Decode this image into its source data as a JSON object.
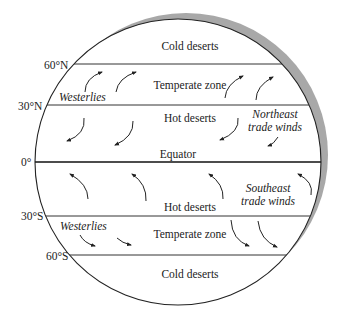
{
  "latitudes": {
    "n60": "60°N",
    "n30": "30°N",
    "eq": "0°",
    "s30": "30°S",
    "s60": "60°S"
  },
  "zones": {
    "north_cold": "Cold deserts",
    "north_temperate": "Temperate zone",
    "north_hot": "Hot deserts",
    "equator": "Equator",
    "south_hot": "Hot deserts",
    "south_temperate": "Temperate zone",
    "south_cold": "Cold deserts"
  },
  "winds": {
    "north_westerlies": "Westerlies",
    "northeast_trade_1": "Northeast",
    "northeast_trade_2": "trade winds",
    "southeast_trade_1": "Southeast",
    "southeast_trade_2": "trade winds",
    "south_westerlies": "Westerlies"
  },
  "colors": {
    "line": "#333333",
    "shadow": "#a8a8a8",
    "text": "#222222"
  }
}
